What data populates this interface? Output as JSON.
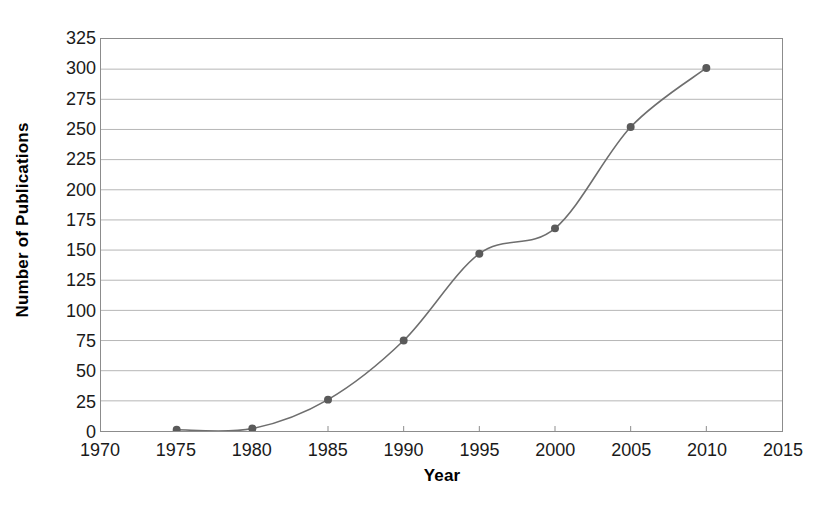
{
  "chart_data": {
    "type": "line",
    "title": "",
    "xlabel": "Year",
    "ylabel": "Number of Publications",
    "x": [
      1975,
      1980,
      1985,
      1990,
      1995,
      2000,
      2005,
      2010
    ],
    "values": [
      1,
      2,
      26,
      75,
      147,
      168,
      252,
      301
    ],
    "series": [
      {
        "name": "Number of Publications",
        "x": [
          1975,
          1980,
          1985,
          1990,
          1995,
          2000,
          2005,
          2010
        ],
        "values": [
          1,
          2,
          26,
          75,
          147,
          168,
          252,
          301
        ]
      }
    ],
    "xlim": [
      1970,
      2015
    ],
    "ylim": [
      0,
      325
    ],
    "xticks": [
      1970,
      1975,
      1980,
      1985,
      1990,
      1995,
      2000,
      2005,
      2010,
      2015
    ],
    "yticks": [
      0,
      25,
      50,
      75,
      100,
      125,
      150,
      175,
      200,
      225,
      250,
      275,
      300,
      325
    ],
    "xtick_labels": [
      "1970",
      "1975",
      "1980",
      "1985",
      "1990",
      "1995",
      "2000",
      "2005",
      "2010",
      "2015"
    ],
    "ytick_labels": [
      "0",
      "25",
      "50",
      "75",
      "100",
      "125",
      "150",
      "175",
      "200",
      "225",
      "250",
      "275",
      "300",
      "325"
    ],
    "grid": {
      "horizontal": true,
      "vertical": false,
      "color": "#b5b5b5"
    },
    "legend": {
      "visible": false,
      "position": "none"
    },
    "smoothing": "spline",
    "colors": {
      "line": "#6e6e6e",
      "marker": "#5a5a5a",
      "axis": "#8c8c8c",
      "text": "#1a1a1a",
      "background": "#ffffff"
    },
    "marker": {
      "shape": "circle",
      "size": 4
    }
  }
}
